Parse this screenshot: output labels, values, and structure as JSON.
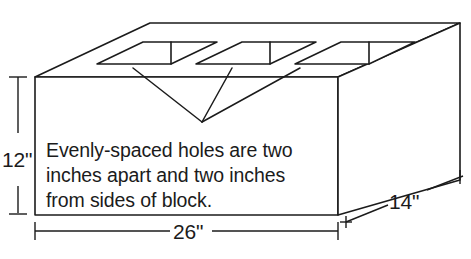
{
  "figure": {
    "note_lines": [
      "Evenly-spaced holes are two",
      "inches apart and two inches",
      "from sides of block."
    ],
    "dimensions": {
      "height": "12\"",
      "width": "26\"",
      "depth": "14\""
    },
    "hole_count": 3,
    "colors": {
      "stroke": "#1b1b1b",
      "fill": "#ffffff",
      "background": "#ffffff"
    }
  }
}
